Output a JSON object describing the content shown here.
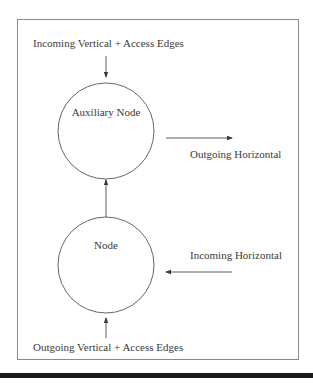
{
  "diagram": {
    "frame": {
      "x": 17,
      "y": 19,
      "width": 282,
      "height": 341,
      "stroke": "#8a8a8a"
    },
    "nodes": [
      {
        "id": "auxiliary",
        "label": "Auxiliary Node",
        "cx": 106,
        "cy": 131,
        "r": 48
      },
      {
        "id": "node",
        "label": "Node",
        "cx": 106,
        "cy": 265,
        "r": 48
      }
    ],
    "edges": [
      {
        "id": "incoming-vertical",
        "label": "Incoming Vertical + Access Edges",
        "direction": "down",
        "target": "auxiliary"
      },
      {
        "id": "node-to-auxiliary",
        "label": "",
        "direction": "up",
        "from": "node",
        "to": "auxiliary"
      },
      {
        "id": "outgoing-horizontal",
        "label": "Outgoing Horizontal",
        "direction": "right",
        "from": "auxiliary"
      },
      {
        "id": "incoming-horizontal",
        "label": "Incoming Horizontal",
        "direction": "left",
        "target": "node"
      },
      {
        "id": "outgoing-vertical",
        "label": "Outgoing Vertical + Access Edges",
        "direction": "up",
        "target": "node"
      }
    ],
    "colors": {
      "line": "#4a4a4a",
      "text": "#3a3a3a",
      "bar": "#1a1a1a"
    }
  }
}
